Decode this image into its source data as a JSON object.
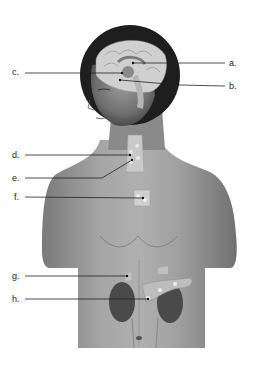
{
  "diagram": {
    "labels": [
      {
        "id": "a",
        "text": "a.",
        "side": "right",
        "x": 229,
        "y": 63,
        "target": [
          133,
          63
        ]
      },
      {
        "id": "b",
        "text": "b.",
        "side": "right",
        "x": 229,
        "y": 86,
        "target": [
          120,
          80
        ]
      },
      {
        "id": "c",
        "text": "c.",
        "side": "left",
        "x": 12,
        "y": 72,
        "target": [
          122,
          73
        ]
      },
      {
        "id": "d",
        "text": "d.",
        "side": "left",
        "x": 12,
        "y": 155,
        "target": [
          130,
          155
        ]
      },
      {
        "id": "e",
        "text": "e.",
        "side": "left",
        "x": 12,
        "y": 178,
        "target": [
          132,
          160
        ]
      },
      {
        "id": "f",
        "text": "f.",
        "side": "left",
        "x": 14,
        "y": 197,
        "target": [
          143,
          198
        ]
      },
      {
        "id": "g",
        "text": "g.",
        "side": "left",
        "x": 12,
        "y": 276,
        "target": [
          127,
          276
        ]
      },
      {
        "id": "h",
        "text": "h.",
        "side": "left",
        "x": 12,
        "y": 299,
        "target": [
          148,
          299
        ]
      }
    ]
  }
}
